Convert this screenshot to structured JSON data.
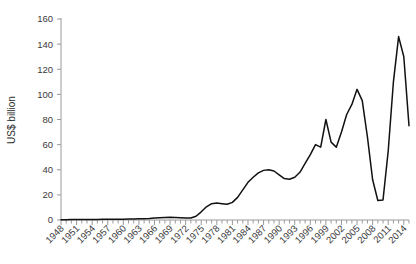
{
  "chart_data": {
    "type": "line",
    "title": "",
    "xlabel": "",
    "ylabel": "US$ billion",
    "ylim": [
      0,
      160
    ],
    "ytick_values": [
      0,
      20,
      40,
      60,
      80,
      100,
      120,
      140,
      160
    ],
    "ytick_labels": [
      "0",
      "20",
      "40",
      "60",
      "80",
      "100",
      "120",
      "140",
      "160"
    ],
    "xlim": [
      1948,
      2015
    ],
    "xtick_labels": [
      "1948",
      "1951",
      "1954",
      "1957",
      "1960",
      "1963",
      "1966",
      "1969",
      "1972",
      "1975",
      "1978",
      "1981",
      "1984",
      "1987",
      "1990",
      "1993",
      "1996",
      "1999",
      "2002",
      "2005",
      "2008",
      "2011",
      "2014"
    ],
    "xtick_step_years": 3,
    "minor_ticks": "every year",
    "grid": false,
    "legend": null,
    "line_color": "#111111",
    "axis_color": "#9a9a9a",
    "background_color": "#ffffff",
    "x": [
      1948,
      1949,
      1950,
      1951,
      1952,
      1953,
      1954,
      1955,
      1956,
      1957,
      1958,
      1959,
      1960,
      1961,
      1962,
      1963,
      1964,
      1965,
      1966,
      1967,
      1968,
      1969,
      1970,
      1971,
      1972,
      1973,
      1974,
      1975,
      1976,
      1977,
      1978,
      1979,
      1980,
      1981,
      1982,
      1983,
      1984,
      1985,
      1986,
      1987,
      1988,
      1989,
      1990,
      1991,
      1992,
      1993,
      1994,
      1995,
      1996,
      1997,
      1998,
      1999,
      2000,
      2001,
      2002,
      2003,
      2004,
      2005,
      2006,
      2007,
      2008,
      2009,
      2010,
      2011,
      2012,
      2013,
      2014,
      2015
    ],
    "values": [
      0.2,
      0.2,
      0.3,
      0.3,
      0.3,
      0.3,
      0.4,
      0.4,
      0.5,
      0.5,
      0.5,
      0.6,
      0.6,
      0.7,
      0.8,
      0.9,
      1.0,
      1.2,
      1.5,
      1.8,
      2.0,
      2.1,
      2.0,
      1.7,
      1.5,
      1.6,
      3.0,
      6.5,
      10.5,
      13.0,
      13.5,
      13.0,
      12.5,
      14.0,
      18.0,
      24.0,
      30.0,
      34.0,
      37.5,
      39.5,
      40.0,
      39.0,
      36.0,
      33.0,
      32.5,
      34.0,
      38.0,
      45.0,
      52.0,
      60.0,
      58.0,
      80.0,
      62.0,
      58.0,
      70.0,
      84.0,
      92.0,
      104.0,
      95.0,
      66.0,
      32.0,
      15.5,
      16.0,
      55.0,
      110.0,
      146.0,
      130.0,
      75.0
    ]
  }
}
